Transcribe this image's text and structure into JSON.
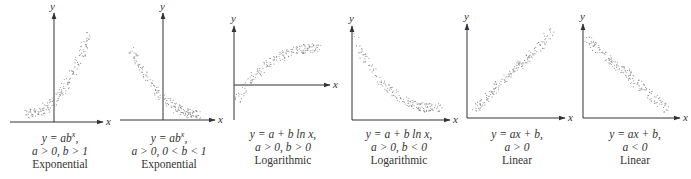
{
  "chart_data": [
    {
      "type": "scatter",
      "title": "Exponential",
      "equation": "y = ab^x,",
      "conditions": "a > 0, b > 1",
      "xlabel": "x",
      "ylabel": "y",
      "trend": "increasing exponential",
      "grid": false,
      "axes": {
        "origin": "y-axis at center, x-axis at bottom"
      },
      "points_desc": "dotted band rising slowly then steeply, left to right"
    },
    {
      "type": "scatter",
      "title": "Exponential",
      "equation": "y = ab^x,",
      "conditions": "a > 0, 0 < b < 1",
      "xlabel": "x",
      "ylabel": "y",
      "trend": "decreasing exponential",
      "grid": false,
      "axes": {
        "origin": "y-axis at center, x-axis at bottom"
      },
      "points_desc": "dotted band falling steeply then flattening"
    },
    {
      "type": "scatter",
      "title": "Logarithmic",
      "equation": "y = a + b ln x,",
      "conditions": "a > 0, b > 0",
      "xlabel": "x",
      "ylabel": "y",
      "trend": "increasing logarithmic",
      "grid": false,
      "axes": {
        "origin": "y-axis at left, x-axis crosses mid-height"
      },
      "points_desc": "dotted band rising from below x-axis then leveling off"
    },
    {
      "type": "scatter",
      "title": "Logarithmic",
      "equation": "y = a + b ln x,",
      "conditions": "a > 0, b < 0",
      "xlabel": "x",
      "ylabel": "y",
      "trend": "decreasing logarithmic",
      "grid": false,
      "axes": {
        "origin": "y-axis at left, x-axis at bottom"
      },
      "points_desc": "dotted band dropping steeply then gradually decreasing"
    },
    {
      "type": "scatter",
      "title": "Linear",
      "equation": "y = ax + b,",
      "conditions": "a > 0",
      "xlabel": "x",
      "ylabel": "y",
      "trend": "increasing linear",
      "grid": false,
      "axes": {
        "origin": "y-axis at left, x-axis at bottom"
      },
      "points_desc": "dotted band rising along a straight line"
    },
    {
      "type": "scatter",
      "title": "Linear",
      "equation": "y = ax + b,",
      "conditions": "a < 0",
      "xlabel": "x",
      "ylabel": "y",
      "trend": "decreasing linear",
      "grid": false,
      "axes": {
        "origin": "y-axis at left, x-axis at bottom"
      },
      "points_desc": "dotted band falling along a straight line"
    }
  ],
  "panels": [
    {
      "eq": "y = ab",
      "sup": "x",
      "eq_tail": ",",
      "cond": "a > 0, b > 1",
      "name": "Exponential"
    },
    {
      "eq": "y = ab",
      "sup": "x",
      "eq_tail": ",",
      "cond": "a > 0, 0 < b < 1",
      "name": "Exponential"
    },
    {
      "eq": "y = a + b ln x,",
      "sup": "",
      "eq_tail": "",
      "cond": "a > 0, b > 0",
      "name": "Logarithmic"
    },
    {
      "eq": "y = a + b ln x,",
      "sup": "",
      "eq_tail": "",
      "cond": "a > 0, b < 0",
      "name": "Logarithmic"
    },
    {
      "eq": "y = ax + b,",
      "sup": "",
      "eq_tail": "",
      "cond": "a > 0",
      "name": "Linear"
    },
    {
      "eq": "y = ax + b,",
      "sup": "",
      "eq_tail": "",
      "cond": "a < 0",
      "name": "Linear"
    }
  ],
  "axis_labels": {
    "x": "x",
    "y": "y"
  },
  "colors": {
    "axis": "#333333",
    "dots": "#8a8a8a",
    "text": "#333333"
  }
}
